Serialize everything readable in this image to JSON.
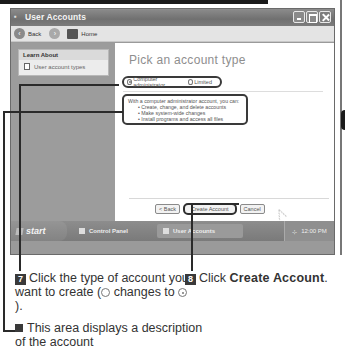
{
  "window": {
    "title": "User Accounts",
    "controls": [
      "minimize",
      "maximize",
      "close"
    ]
  },
  "toolbar": {
    "back_label": "Back",
    "home_label": "Home"
  },
  "sidebar": {
    "heading": "Learn About",
    "items": [
      {
        "label": "User account types",
        "icon": "document-icon"
      }
    ]
  },
  "main": {
    "title": "Pick an account type",
    "options": [
      {
        "label": "Computer administrator",
        "selected": true
      },
      {
        "label": "Limited",
        "selected": false
      }
    ],
    "description": {
      "intro": "With a computer administrator account, you can:",
      "bullets": [
        "Create, change, and delete accounts",
        "Make system-wide changes",
        "Install programs and access all files"
      ]
    },
    "buttons": {
      "back": "< Back",
      "create": "Create Account",
      "cancel": "Cancel"
    }
  },
  "taskbar": {
    "start_label": "start",
    "tasks": [
      "Control Panel",
      "User Accounts"
    ],
    "clock": "12:00 PM"
  },
  "callouts": {
    "step7": {
      "number": "7",
      "text_a": "Click the type of account you want to create (",
      "text_b": " changes to ",
      "text_c": ")."
    },
    "step8": {
      "number": "8",
      "text_a": "Click ",
      "bold": "Create Account",
      "text_c": "."
    },
    "note": {
      "text": "This area displays a description of the account"
    }
  }
}
